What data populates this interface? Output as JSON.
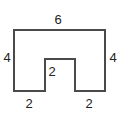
{
  "figure": {
    "type": "geometry-diagram",
    "shape_name": "rectilinear-notched-polygon",
    "stroke_color": "#4a4a4a",
    "fill_color": "#ffffff",
    "background_color": "#ffffff",
    "stroke_width": 2,
    "outline_points": "14,30 105,30 105,91 75,91 75,59 45,59 45,91 14,91",
    "labels": {
      "top_width": "6",
      "left_height": "4",
      "right_height": "4",
      "notch_height": "2",
      "bottom_left_width": "2",
      "bottom_right_width": "2"
    }
  },
  "chart_data": {
    "type": "diagram",
    "title": "",
    "shape": "notched rectangle (U-shape / rectangle with rectangular notch cut from bottom center)",
    "dimensions": [
      {
        "name": "top side",
        "value": 6,
        "position": "top"
      },
      {
        "name": "left side",
        "value": 4,
        "position": "left"
      },
      {
        "name": "right side",
        "value": 4,
        "position": "right"
      },
      {
        "name": "notch depth",
        "value": 2,
        "position": "interior-notch"
      },
      {
        "name": "bottom left segment",
        "value": 2,
        "position": "bottom-left"
      },
      {
        "name": "bottom right segment",
        "value": 2,
        "position": "bottom-right"
      }
    ]
  }
}
